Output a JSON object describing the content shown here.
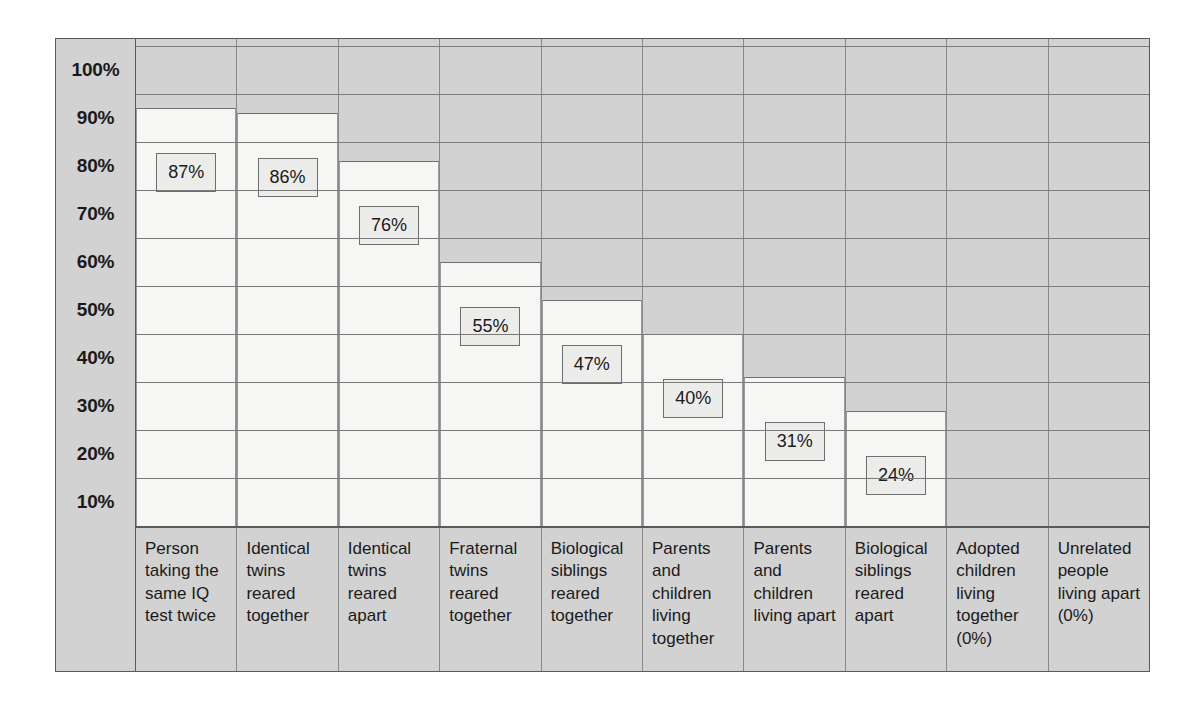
{
  "chart_data": {
    "type": "bar",
    "title": "",
    "subtitle": "",
    "xlabel": "",
    "ylabel": "",
    "ylim": [
      0,
      100
    ],
    "grid": true,
    "legend": "none",
    "y_ticks": [
      "100%",
      "90%",
      "80%",
      "70%",
      "60%",
      "50%",
      "40%",
      "30%",
      "20%",
      "10%"
    ],
    "y_tick_values": [
      100,
      90,
      80,
      70,
      60,
      50,
      40,
      30,
      20,
      10
    ],
    "categories": [
      "Person taking the same IQ test twice",
      "Identical twins reared together",
      "Identical twins reared apart",
      "Fraternal twins reared together",
      "Biological siblings reared together",
      "Parents and children living together",
      "Parents and children living apart",
      "Biological siblings reared apart",
      "Adopted children living together (0%)",
      "Unrelated people living apart (0%)"
    ],
    "values": [
      87,
      86,
      76,
      55,
      47,
      40,
      31,
      24,
      0,
      0
    ],
    "value_labels": [
      "87%",
      "86%",
      "76%",
      "55%",
      "47%",
      "40%",
      "31%",
      "24%",
      "",
      ""
    ],
    "colors": {
      "plot_background": "#d2d2d2",
      "bar_fill": "#f6f6f4",
      "gridline": "#7a7a7a",
      "border": "#5a5a5a",
      "label_box_fill": "#ececea",
      "text": "#1a1a1a"
    }
  }
}
